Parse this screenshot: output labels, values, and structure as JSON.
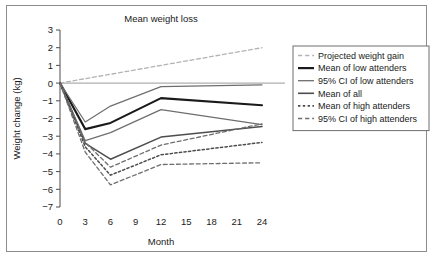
{
  "figure": {
    "title": "Mean weight loss",
    "xlabel": "Month",
    "ylabel": "Weight change (kg)"
  },
  "chart_data": {
    "type": "line",
    "title": "Mean weight loss",
    "xlabel": "Month",
    "ylabel": "Weight change (kg)",
    "xlim": [
      0,
      24
    ],
    "ylim": [
      -7,
      3
    ],
    "xticks": [
      0,
      3,
      6,
      9,
      12,
      15,
      18,
      21,
      24
    ],
    "yticks": [
      3,
      2,
      1,
      0,
      -1,
      -2,
      -3,
      -4,
      -5,
      -6,
      -7
    ],
    "grid": false,
    "legend_position": "right",
    "zero_reference_line": 0,
    "series": [
      {
        "name": "Projected weight gain",
        "style": "dashed",
        "color": "#b3b3b3",
        "width": 1.3,
        "x": [
          0,
          24
        ],
        "values": [
          0,
          2
        ]
      },
      {
        "name": "Mean of low attenders",
        "style": "solid",
        "color": "#1a1a1a",
        "width": 2.1,
        "x": [
          0,
          3,
          6,
          12,
          24
        ],
        "values": [
          0,
          -2.6,
          -2.25,
          -0.85,
          -1.25
        ]
      },
      {
        "name": "95% CI of low attenders",
        "style": "solid",
        "color": "#6e6e6e",
        "width": 1.2,
        "x": [
          0,
          3,
          6,
          12,
          24
        ],
        "values": [
          0,
          -2.2,
          -1.3,
          -0.2,
          -0.1
        ]
      },
      {
        "name": "95% CI of low attenders (lower)",
        "style": "solid",
        "color": "#6e6e6e",
        "width": 1.2,
        "x": [
          0,
          3,
          6,
          12,
          24
        ],
        "values": [
          0,
          -3.25,
          -2.8,
          -1.5,
          -2.35
        ]
      },
      {
        "name": "Mean of all",
        "style": "solid",
        "color": "#4d4d4d",
        "width": 1.5,
        "x": [
          0,
          3,
          6,
          12,
          24
        ],
        "values": [
          0,
          -3.4,
          -4.3,
          -3.05,
          -2.45
        ]
      },
      {
        "name": "Mean of high attenders",
        "style": "dotted",
        "color": "#4d4d4d",
        "width": 1.5,
        "x": [
          0,
          3,
          6,
          12,
          24
        ],
        "values": [
          0,
          -3.6,
          -5.2,
          -4.05,
          -3.35
        ]
      },
      {
        "name": "95% CI of high attenders",
        "style": "dashed",
        "color": "#6e6e6e",
        "width": 1.3,
        "x": [
          0,
          3,
          6,
          12,
          24
        ],
        "values": [
          0,
          -3.35,
          -4.75,
          -3.5,
          -2.3
        ]
      },
      {
        "name": "95% CI of high attenders (lower)",
        "style": "dashed",
        "color": "#6e6e6e",
        "width": 1.3,
        "x": [
          0,
          3,
          6,
          12,
          24
        ],
        "values": [
          0,
          -3.9,
          -5.75,
          -4.6,
          -4.5
        ]
      }
    ],
    "legend": [
      {
        "label": "Projected weight gain",
        "style": "dashed",
        "color": "#b3b3b3",
        "width": 1.4
      },
      {
        "label": "Mean of low attenders",
        "style": "solid",
        "color": "#1a1a1a",
        "width": 2.2
      },
      {
        "label": "95% CI of low attenders",
        "style": "solid",
        "color": "#6e6e6e",
        "width": 1.3
      },
      {
        "label": "Mean of all",
        "style": "solid",
        "color": "#4d4d4d",
        "width": 1.6
      },
      {
        "label": "Mean of high attenders",
        "style": "dotted",
        "color": "#4d4d4d",
        "width": 1.6
      },
      {
        "label": "95% CI of high attenders",
        "style": "dashed",
        "color": "#6e6e6e",
        "width": 1.4
      }
    ]
  }
}
